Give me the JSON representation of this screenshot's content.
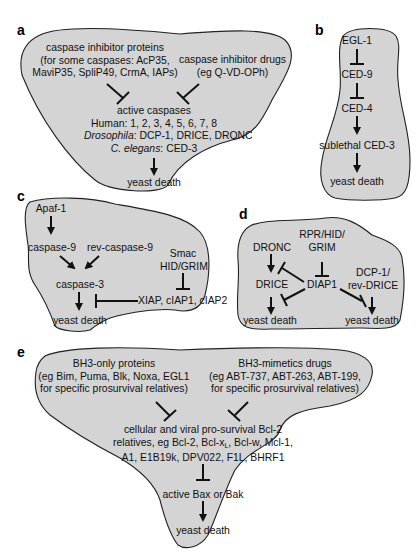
{
  "panels": {
    "a": {
      "letter": "a",
      "inhibitor_proteins": [
        "caspase inhibitor proteins",
        "(for some caspases: AcP35,",
        "MaviP35, SpliP49, CrmA, IAPs)"
      ],
      "inhibitor_drugs": [
        "caspase inhibitor drugs",
        "(eg Q-VD-OPh)"
      ],
      "active_caspases": "active caspases",
      "human": "Human: 1, 2, 3, 4, 5, 6, 7, 8",
      "drosophila_species": "Drosophila",
      "drosophila_list": ": DCP-1, DRICE, DRONC",
      "celegans_species": "C. elegans",
      "celegans_list": ": CED-3",
      "outcome": "yeast death"
    },
    "b": {
      "letter": "b",
      "nodes": [
        "EGL-1",
        "CED-9",
        "CED-4",
        "sublethal CED-3",
        "yeast death"
      ]
    },
    "c": {
      "letter": "c",
      "apaf": "Apaf-1",
      "casp9": "caspase-9",
      "rev_casp9": "rev-caspase-9",
      "smac": "Smac",
      "hid_grim": "HID/GRIM",
      "casp3": "caspase-3",
      "iaps": "XIAP, cIAP1, cIAP2",
      "outcome": "yeast death"
    },
    "d": {
      "letter": "d",
      "dronc": "DRONC",
      "rpr_line1": "RPR/HID/",
      "rpr_line2": "GRIM",
      "drice": "DRICE",
      "diap1": "DIAP1",
      "dcp_line1": "DCP-1/",
      "dcp_line2": "rev-DRICE",
      "outcome_left": "yeast death",
      "outcome_right": "yeast death"
    },
    "e": {
      "letter": "e",
      "bh3_proteins": [
        "BH3-only proteins",
        "(eg Bim, Puma, Blk, Noxa, EGL1",
        "for specific prosurvival relatives)"
      ],
      "bh3_drugs": [
        "BH3-mimetics drugs",
        "(eg ABT-737, ABT-263, ABT-199,",
        "for specific prosurvival relatives)"
      ],
      "bcl2_line1": "cellular and viral pro-survival Bcl-2",
      "bcl2_line2a": "relatives, eg Bcl-2, Bcl-x",
      "bcl2_line2_sub": "L",
      "bcl2_line2b": ", Bcl-w, Mcl-1,",
      "bcl2_line3": "A1, E1B19k, DPV022, F1L, BHRF1",
      "bax_bak": "active Bax or Bak",
      "outcome": "yeast death"
    }
  },
  "colors": {
    "blob_fill": "#d4d4d4",
    "outline": "#222222",
    "text": "#111111"
  }
}
